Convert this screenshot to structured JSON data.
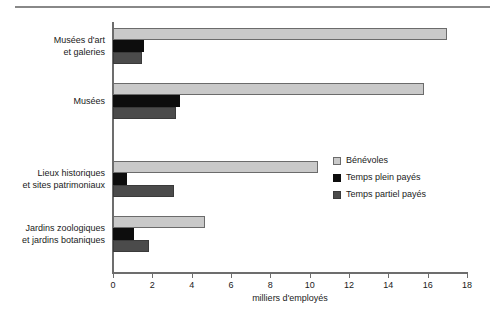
{
  "chart_data": {
    "type": "bar",
    "orientation": "horizontal",
    "title": "",
    "xlabel": "milliers d'employés",
    "ylabel": "",
    "xlim": [
      0,
      18
    ],
    "xticks": [
      0,
      2,
      4,
      6,
      8,
      10,
      12,
      14,
      16,
      18
    ],
    "grid": false,
    "legend_position": "center-right",
    "categories": [
      "Musées d'art et galeries",
      "Musées",
      "Lieux historiques et sites patrimoniaux",
      "Jardins zoologiques et jardins botaniques"
    ],
    "category_lines": [
      [
        "Musées d'art",
        "et galeries"
      ],
      [
        "Musées"
      ],
      [
        "Lieux historiques",
        "et sites patrimoniaux"
      ],
      [
        "Jardins zoologiques",
        "et jardins botaniques"
      ]
    ],
    "series": [
      {
        "name": "Bénévoles",
        "color": "#c9c9c9",
        "values": [
          17.0,
          15.8,
          10.4,
          4.7
        ]
      },
      {
        "name": "Temps plein payés",
        "color": "#0d0d0d",
        "values": [
          1.6,
          3.4,
          0.7,
          1.05
        ]
      },
      {
        "name": "Temps partiel payés",
        "color": "#4b4b4b",
        "values": [
          1.45,
          3.2,
          3.1,
          1.85
        ]
      }
    ]
  },
  "legend": {
    "items": [
      {
        "label": "Bénévoles"
      },
      {
        "label": "Temps plein payés"
      },
      {
        "label": "Temps partiel payés"
      }
    ]
  },
  "axis": {
    "x_title": "milliers d'employés",
    "tick_labels": [
      "0",
      "2",
      "4",
      "6",
      "8",
      "10",
      "12",
      "14",
      "16",
      "18"
    ]
  },
  "colors": {
    "series_benevoles": "#c9c9c9",
    "series_temps_plein": "#0d0d0d",
    "series_temps_partiel": "#4b4b4b",
    "axis": "#6d6d6d",
    "rule": "#888888",
    "text": "#1a1a1a",
    "background": "#ffffff"
  }
}
